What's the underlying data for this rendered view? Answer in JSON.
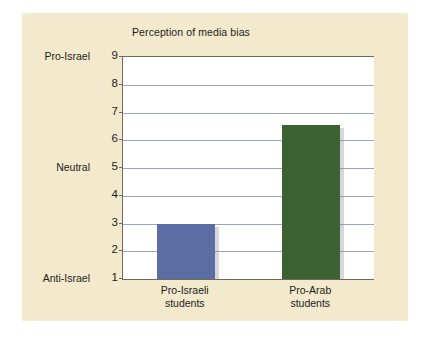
{
  "figure": {
    "background_color": "#f3e9cd",
    "plot_background_color": "#ffffff",
    "axis_color": "#6f6a5d",
    "gridline_color": "#98a4c6"
  },
  "chart_data": {
    "type": "bar",
    "title": "Perception of media bias",
    "xlabel": "",
    "ylabel": "",
    "categories": [
      "Pro-Israeli students",
      "Pro-Arab students"
    ],
    "category_lines": [
      [
        "Pro-Israeli",
        "students"
      ],
      [
        "Pro-Arab",
        "students"
      ]
    ],
    "values": [
      3.0,
      6.55
    ],
    "series": [
      {
        "name": "Perception of media bias",
        "values": [
          3.0,
          6.55
        ],
        "colors": [
          "#5c6da4",
          "#3c6233"
        ]
      }
    ],
    "ylim": [
      1,
      9
    ],
    "yticks": [
      9,
      8,
      7,
      6,
      5,
      4,
      3,
      2,
      1
    ],
    "ytick_labels": [
      "9",
      "8",
      "7",
      "6",
      "5",
      "4",
      "3",
      "2",
      "1"
    ],
    "y_anchor_labels": [
      {
        "label": "Pro-Israel",
        "value": 9
      },
      {
        "label": "Neutral",
        "value": 5
      },
      {
        "label": "Anti-Israel",
        "value": 1
      }
    ],
    "grid": true,
    "grid_axis": "y",
    "legend": false,
    "legend_position": "none"
  }
}
